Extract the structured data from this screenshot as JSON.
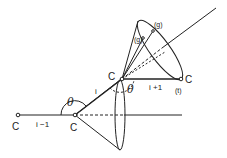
{
  "diagram": {
    "title": "",
    "atoms": [
      {
        "id": "c-left",
        "label": "C"
      },
      {
        "id": "c-mid",
        "label": "C"
      },
      {
        "id": "c-upper",
        "label": "C"
      },
      {
        "id": "c-right",
        "label": "C"
      }
    ],
    "bonds": [
      {
        "id": "bond-i-minus-1",
        "label": "i −1"
      },
      {
        "id": "bond-i",
        "label": "i"
      },
      {
        "id": "bond-i-plus-1",
        "label": "i +1"
      }
    ],
    "angles": [
      {
        "id": "theta-lower",
        "label": "θ"
      },
      {
        "id": "theta-upper",
        "label": "θ"
      }
    ],
    "states": [
      {
        "id": "state-t",
        "label": "(t)"
      },
      {
        "id": "state-g-outer",
        "label": "(g)"
      },
      {
        "id": "state-g-inner",
        "label": "(g)"
      }
    ],
    "colors": {
      "line": "#222222",
      "background": "#ffffff"
    }
  }
}
